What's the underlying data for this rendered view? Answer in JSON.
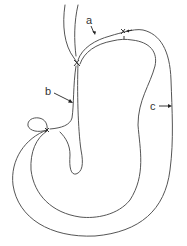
{
  "diagram": {
    "labels": [
      {
        "id": "a",
        "text": "a"
      },
      {
        "id": "b",
        "text": "b"
      },
      {
        "id": "c",
        "text": "c"
      }
    ]
  },
  "colors": {
    "line": "#555555",
    "label": "#333333",
    "background": "#ffffff"
  }
}
